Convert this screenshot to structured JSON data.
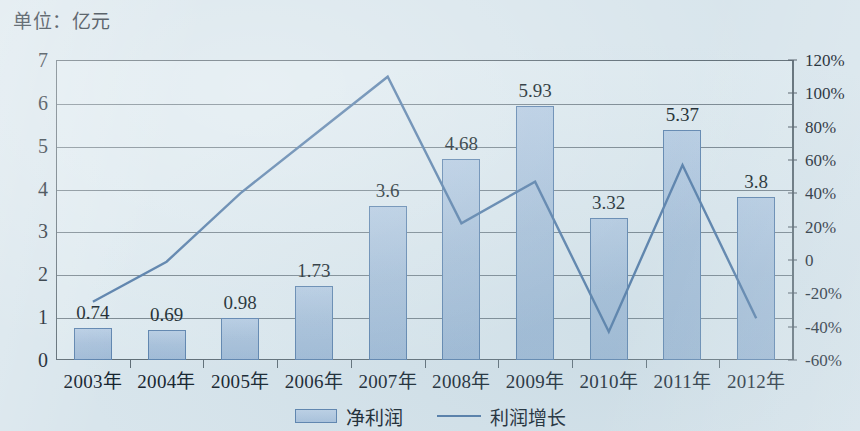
{
  "unit_caption": "单位：亿元",
  "legend": {
    "bar_label": "净利润",
    "line_label": "利润增长",
    "bar_swatch_name": "bar-swatch",
    "line_swatch_name": "line-swatch"
  },
  "colors": {
    "background": "#d8e5ec",
    "bar_fill": "#a7c0da",
    "bar_border": "#5b82ad",
    "line": "#5079a6",
    "grid": "#75838c",
    "frame": "#5d6b74",
    "text": "#14222c"
  },
  "chart_data": {
    "type": "bar",
    "title": "单位：亿元",
    "xlabel": "",
    "ylabel": "亿元",
    "categories": [
      "2003年",
      "2004年",
      "2005年",
      "2006年",
      "2007年",
      "2008年",
      "2009年",
      "2010年",
      "2011年",
      "2012年"
    ],
    "grid": true,
    "legend_position": "bottom",
    "series": [
      {
        "name": "净利润",
        "type": "bar",
        "axis": "left",
        "unit": "亿元",
        "values": [
          0.74,
          0.69,
          0.98,
          1.73,
          3.6,
          4.68,
          5.93,
          3.32,
          5.37,
          3.8
        ],
        "labels": [
          "0.74",
          "0.69",
          "0.98",
          "1.73",
          "3.6",
          "4.68",
          "5.93",
          "3.32",
          "5.37",
          "3.8"
        ]
      },
      {
        "name": "利润增长",
        "type": "line",
        "axis": "right",
        "unit": "%",
        "values": [
          -25,
          -1,
          40,
          75,
          110,
          22,
          47,
          -43,
          57,
          -35
        ]
      }
    ],
    "left_axis": {
      "ticks": [
        "0",
        "1",
        "2",
        "3",
        "4",
        "5",
        "6",
        "7"
      ],
      "values": [
        0,
        1,
        2,
        3,
        4,
        5,
        6,
        7
      ],
      "ylim": [
        0,
        7
      ]
    },
    "right_axis": {
      "ticks": [
        "-60%",
        "-40%",
        "-20%",
        "0",
        "20%",
        "40%",
        "60%",
        "80%",
        "100%",
        "120%"
      ],
      "values": [
        -60,
        -40,
        -20,
        0,
        20,
        40,
        60,
        80,
        100,
        120
      ],
      "ylim": [
        -60,
        120
      ]
    }
  }
}
